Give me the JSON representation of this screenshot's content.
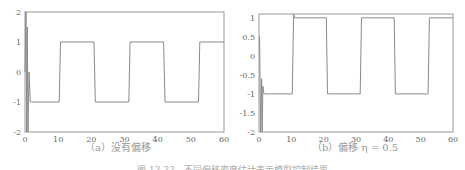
{
  "chart_data": [
    {
      "type": "line",
      "title": "",
      "caption": "（a）没有偏移",
      "xlabel": "",
      "ylabel": "",
      "xlim": [
        0,
        60
      ],
      "ylim": [
        -2,
        2
      ],
      "xticks": [
        0,
        10,
        20,
        30,
        40,
        50,
        60
      ],
      "yticks": [
        -2,
        -1,
        0,
        1,
        2
      ],
      "grid": false,
      "series": [
        {
          "name": "response",
          "color": "#8a8a8a",
          "x": [
            0,
            0.3,
            0.5,
            0.7,
            0.9,
            1.2,
            1.6,
            10.3,
            10.7,
            20.8,
            21.2,
            31.3,
            31.7,
            41.8,
            42.2,
            52.3,
            52.7,
            60
          ],
          "y": [
            0,
            2,
            -2,
            1.5,
            -2,
            0,
            -1,
            -1,
            1,
            1,
            -1,
            -1,
            1,
            1,
            -1,
            -1,
            1,
            1
          ]
        }
      ]
    },
    {
      "type": "line",
      "title": "",
      "caption": "（b）偏移 η = 0.5",
      "xlabel": "",
      "ylabel": "",
      "xlim": [
        0,
        60
      ],
      "ylim": [
        -2,
        1.1
      ],
      "xticks": [
        0,
        10,
        20,
        30,
        40,
        50,
        60
      ],
      "yticks": [
        -2,
        -1.5,
        -1,
        -0.5,
        0,
        0.5,
        1
      ],
      "grid": false,
      "series": [
        {
          "name": "response",
          "color": "#8a8a8a",
          "x": [
            0,
            0.2,
            0.5,
            0.8,
            1.0,
            1.2,
            1.5,
            2,
            10.3,
            10.7,
            11,
            20.8,
            21.2,
            21.5,
            31.3,
            31.7,
            41.8,
            42.2,
            52.3,
            52.7,
            60
          ],
          "y": [
            0.5,
            0.5,
            -2,
            -0.6,
            -2,
            -0.8,
            -1,
            -1,
            -1,
            1.1,
            1,
            1,
            -1,
            -1,
            -1,
            1,
            1,
            -1,
            -1,
            1,
            1
          ]
        }
      ]
    }
  ],
  "panels": {
    "left": {
      "caption": "（a）没有偏移",
      "yticks": [
        "2",
        "1",
        "0",
        "-1",
        "-2"
      ],
      "xticks": [
        "0",
        "10",
        "20",
        "30",
        "40",
        "50",
        "60"
      ]
    },
    "right": {
      "caption": "（b）偏移 η = 0.5",
      "yticks": [
        "1",
        "0.5",
        "0",
        "-0.5",
        "-1",
        "-1.5",
        "-2"
      ],
      "xticks": [
        "0",
        "10",
        "20",
        "30",
        "40",
        "50",
        "60"
      ]
    }
  },
  "figure_caption": "图 13-33　不同偏移密度估计表示模型控制结果"
}
